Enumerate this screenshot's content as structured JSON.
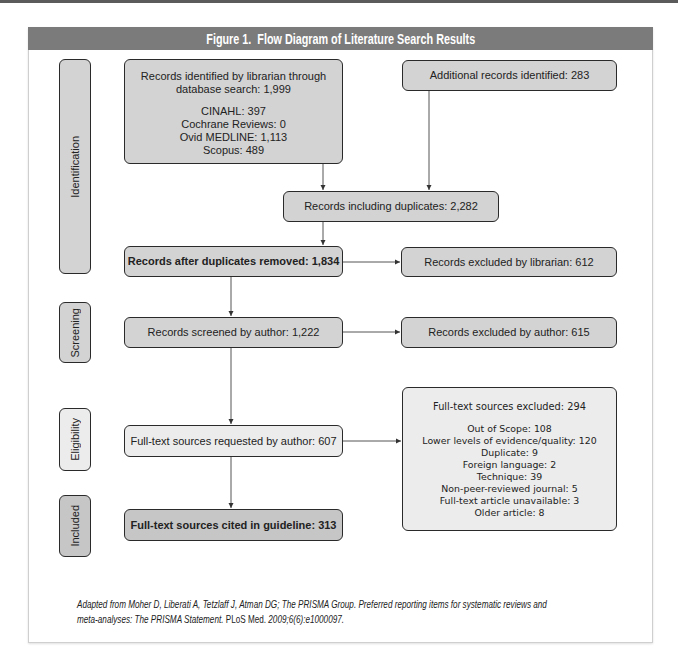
{
  "figure": {
    "title": "Figure 1.  Flow Diagram of Literature Search Results"
  },
  "phases": {
    "identification": "Identification",
    "screening": "Screening",
    "eligibility": "Eligibility",
    "included": "Included"
  },
  "boxes": {
    "identified": {
      "line1": "Records identified by librarian through",
      "line2": "database search: 1,999",
      "sources": [
        "CINAHL: 397",
        "Cochrane Reviews: 0",
        "Ovid MEDLINE: 1,113",
        "Scopus: 489"
      ]
    },
    "additional": "Additional records identified: 283",
    "including_duplicates": "Records including duplicates: 2,282",
    "after_duplicates_removed": "Records after duplicates removed: 1,834",
    "excluded_by_librarian": "Records excluded by librarian: 612",
    "screened_by_author": "Records screened by author: 1,222",
    "excluded_by_author": "Records excluded by author: 615",
    "fulltext_requested": "Full-text sources requested by author: 607",
    "fulltext_excluded": {
      "title": "Full-text sources excluded: 294",
      "reasons": [
        "Out of Scope: 108",
        "Lower levels of evidence/quality: 120",
        "Duplicate: 9",
        "Foreign language: 2",
        "Technique: 39",
        "Non-peer-reviewed journal: 5",
        "Full-text article unavailable: 3",
        "Older article: 8"
      ]
    },
    "fulltext_cited": "Full-text sources cited in guideline: 313"
  },
  "caption": {
    "line1": "Adapted from Moher D, Liberati A, Tetzlaff J, Atman DG; The PRISMA Group. Preferred reporting items for systematic reviews and",
    "line2_italic": "meta-analyses: The PRISMA Statement.",
    "line2_journal": " PLoS Med. ",
    "line2_citation": "2009;6(6):e1000097."
  },
  "colors": {
    "header_bar": "#7b7b7b",
    "box_fill": "#d3d3d3",
    "box_fill_light": "#ececec",
    "box_fill_dark": "#c6c6c6",
    "box_border": "#2a2a2a",
    "connector": "#555555"
  }
}
